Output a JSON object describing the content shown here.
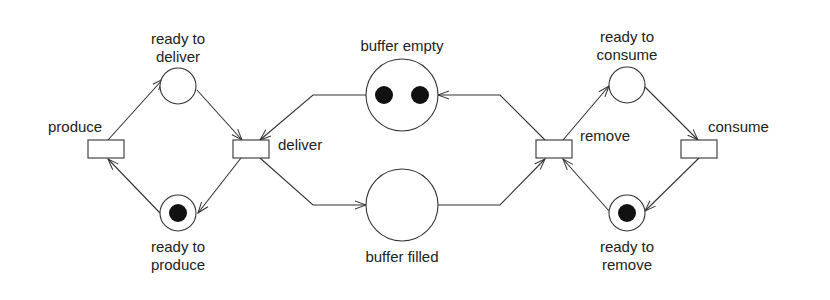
{
  "diagram": {
    "type": "petri-net",
    "colors": {
      "stroke": "#333333",
      "token": "#111111",
      "background": "#ffffff",
      "text": "#222222"
    },
    "places": [
      {
        "id": "ready_to_deliver",
        "label_line1": "ready to",
        "label_line2": "deliver",
        "tokens": 0
      },
      {
        "id": "ready_to_produce",
        "label_line1": "ready to",
        "label_line2": "produce",
        "tokens": 1
      },
      {
        "id": "buffer_empty",
        "label": "buffer empty",
        "tokens": 2
      },
      {
        "id": "buffer_filled",
        "label": "buffer filled",
        "tokens": 0
      },
      {
        "id": "ready_to_consume",
        "label_line1": "ready to",
        "label_line2": "consume",
        "tokens": 0
      },
      {
        "id": "ready_to_remove",
        "label_line1": "ready to",
        "label_line2": "remove",
        "tokens": 1
      }
    ],
    "transitions": [
      {
        "id": "produce",
        "label": "produce"
      },
      {
        "id": "deliver",
        "label": "deliver"
      },
      {
        "id": "remove",
        "label": "remove"
      },
      {
        "id": "consume",
        "label": "consume"
      }
    ],
    "arcs": [
      {
        "from": "produce",
        "to": "ready_to_deliver"
      },
      {
        "from": "ready_to_deliver",
        "to": "deliver"
      },
      {
        "from": "deliver",
        "to": "ready_to_produce"
      },
      {
        "from": "ready_to_produce",
        "to": "produce"
      },
      {
        "from": "buffer_empty",
        "to": "deliver"
      },
      {
        "from": "deliver",
        "to": "buffer_filled"
      },
      {
        "from": "buffer_filled",
        "to": "remove"
      },
      {
        "from": "remove",
        "to": "buffer_empty"
      },
      {
        "from": "remove",
        "to": "ready_to_consume"
      },
      {
        "from": "ready_to_consume",
        "to": "consume"
      },
      {
        "from": "consume",
        "to": "ready_to_remove"
      },
      {
        "from": "ready_to_remove",
        "to": "remove"
      }
    ]
  }
}
